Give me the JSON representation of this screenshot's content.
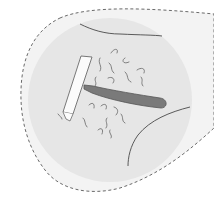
{
  "illustration": {
    "subject": "razor shaving hair on skin",
    "colors": {
      "background": "#ffffff",
      "outer_blob_fill": "#f3f3f3",
      "outline_dash": "#6a6a6a",
      "inner_circle_fill": "#e4e4e4",
      "skin_line": "#4a4a4a",
      "razor_head": "#fbfbfb",
      "razor_head_stroke": "#6a6a6a",
      "razor_handle": "#7a7a7a",
      "razor_handle_stroke": "#555555",
      "hair": "#666666"
    },
    "elements": [
      "dashed-outline-region",
      "inner-skin-circle",
      "skin-crease-lines",
      "razor",
      "hair-strands"
    ]
  }
}
